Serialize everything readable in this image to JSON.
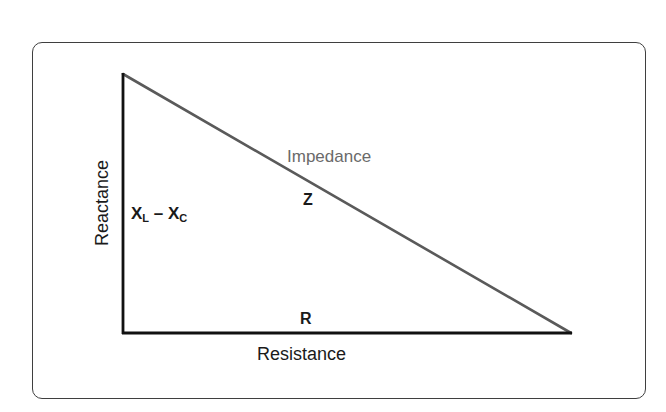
{
  "diagram": {
    "hypotenuse": {
      "name": "Impedance",
      "symbol": "Z",
      "color": "#5a5a5a"
    },
    "vertical_leg": {
      "name": "Reactance",
      "symbol_main_1": "X",
      "symbol_sub_1": "L",
      "operator": " – ",
      "symbol_main_2": "X",
      "symbol_sub_2": "C",
      "color": "#111111"
    },
    "horizontal_leg": {
      "name": "Resistance",
      "symbol": "R",
      "color": "#111111"
    },
    "vertices": {
      "apex": [
        123,
        74
      ],
      "right_angle": [
        123,
        333
      ],
      "end": [
        571,
        333
      ]
    },
    "frame_color": "#3f3f3f"
  }
}
